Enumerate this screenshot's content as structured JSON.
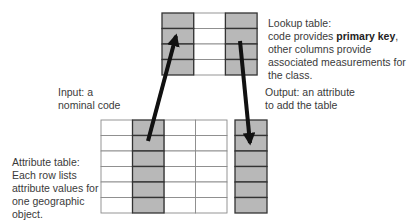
{
  "labels": {
    "lookup": {
      "line1": "Lookup table:",
      "line2_pre": "code provides ",
      "line2_bold": "primary key",
      "line2_post": ",",
      "line3": "other columns provide",
      "line4": "associated measurements for",
      "line5": "the class."
    },
    "input": {
      "line1": "Input: a",
      "line2": "nominal code"
    },
    "output": {
      "line1": "Output: an attribute",
      "line2": "to add the table"
    },
    "attribute": {
      "line1": "Attribute table:",
      "line2": "Each row lists",
      "line3": "attribute values for",
      "line4": "one geographic",
      "line5": "object."
    }
  },
  "tables": {
    "lookup": {
      "rows": 4,
      "columns": 3,
      "shaded_columns": [
        0,
        2
      ]
    },
    "attribute": {
      "rows": 6,
      "columns": 4,
      "shaded_columns": [
        1
      ]
    },
    "output": {
      "rows": 6,
      "columns": 1,
      "shaded_columns": [
        0
      ]
    }
  },
  "colors": {
    "shade": "#b8b8b8",
    "grid": "#8a8a8a",
    "dark_grid": "#333333",
    "arrow": "#111111"
  }
}
